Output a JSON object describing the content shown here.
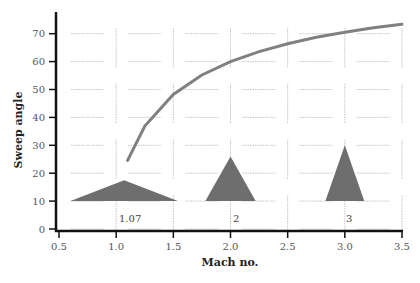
{
  "chart_data": {
    "type": "line",
    "title": "",
    "xlabel": "Mach no.",
    "ylabel": "Sweep angle",
    "xlim": [
      0.5,
      3.5
    ],
    "ylim": [
      0,
      75
    ],
    "x_ticks": [
      "0.5",
      "1.0",
      "1.5",
      "2.0",
      "2.5",
      "3.0",
      "3.5"
    ],
    "y_ticks": [
      "0",
      "10",
      "20",
      "30",
      "40",
      "50",
      "60",
      "70"
    ],
    "grid": "dashed, broken segments",
    "series": [
      {
        "name": "Sweep angle vs Mach",
        "color": "#808080",
        "x": [
          1.1,
          1.25,
          1.5,
          1.75,
          2.0,
          2.25,
          2.5,
          2.75,
          3.0,
          3.25,
          3.5
        ],
        "y": [
          24.6,
          36.9,
          48.2,
          55.2,
          60.0,
          63.6,
          66.4,
          68.7,
          70.5,
          72.1,
          73.4
        ]
      }
    ],
    "annotations": [
      {
        "type": "triangle",
        "label": "1.07",
        "x_center": 1.07,
        "base_y": 10,
        "apex_y": 17.5,
        "half_width_mach": 0.47
      },
      {
        "type": "triangle",
        "label": "2",
        "x_center": 2.0,
        "base_y": 10,
        "apex_y": 26,
        "half_width_mach": 0.22
      },
      {
        "type": "triangle",
        "label": "3",
        "x_center": 3.0,
        "base_y": 10,
        "apex_y": 30,
        "half_width_mach": 0.17
      }
    ],
    "triangle_color": "#6e6e6e"
  },
  "labels": {
    "x_axis_title": "Mach no.",
    "y_axis_title": "Sweep angle",
    "wing_1": "1.07",
    "wing_2": "2",
    "wing_3": "3"
  }
}
